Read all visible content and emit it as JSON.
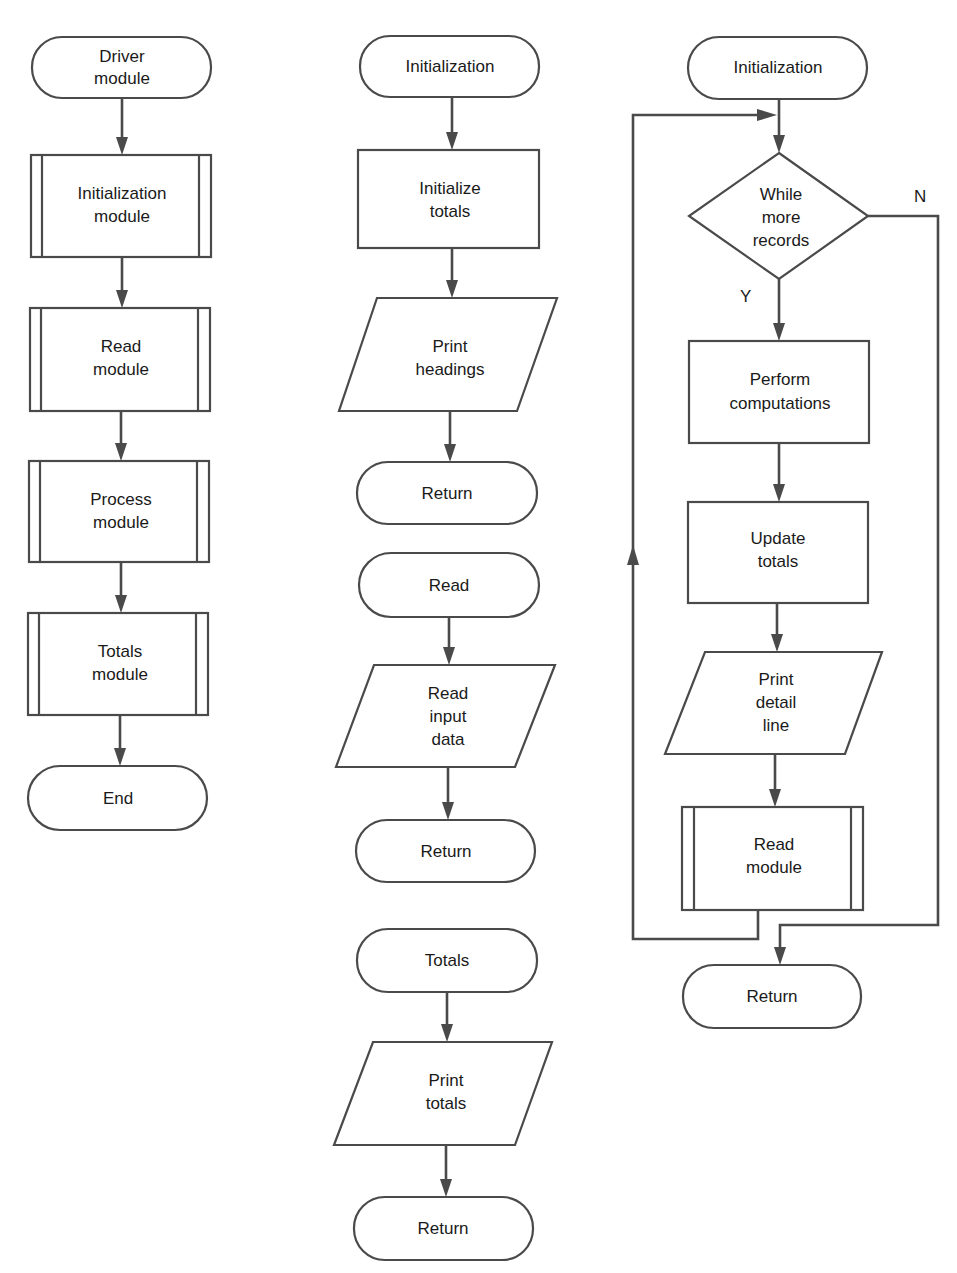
{
  "diagram": {
    "type": "flowchart",
    "colors": {
      "stroke": "#4a4a4a",
      "text": "#1a1a1a",
      "background": "#ffffff"
    },
    "columns": [
      {
        "name": "driver",
        "nodes": [
          {
            "id": "driver",
            "shape": "terminal",
            "lines": [
              "Driver",
              "module"
            ]
          },
          {
            "id": "init_module",
            "shape": "predefined-process",
            "lines": [
              "Initialization",
              "module"
            ]
          },
          {
            "id": "read_module",
            "shape": "predefined-process",
            "lines": [
              "Read",
              "module"
            ]
          },
          {
            "id": "process_module",
            "shape": "predefined-process",
            "lines": [
              "Process",
              "module"
            ]
          },
          {
            "id": "totals_module",
            "shape": "predefined-process",
            "lines": [
              "Totals",
              "module"
            ]
          },
          {
            "id": "end",
            "shape": "terminal",
            "lines": [
              "End"
            ]
          }
        ]
      },
      {
        "name": "subroutines",
        "nodes": [
          {
            "id": "init_start",
            "shape": "terminal",
            "lines": [
              "Initialization"
            ]
          },
          {
            "id": "init_totals",
            "shape": "process",
            "lines": [
              "Initialize",
              "totals"
            ]
          },
          {
            "id": "print_headings",
            "shape": "io",
            "lines": [
              "Print",
              "headings"
            ]
          },
          {
            "id": "init_return",
            "shape": "terminal",
            "lines": [
              "Return"
            ]
          },
          {
            "id": "read_start",
            "shape": "terminal",
            "lines": [
              "Read"
            ]
          },
          {
            "id": "read_input",
            "shape": "io",
            "lines": [
              "Read",
              "input",
              "data"
            ]
          },
          {
            "id": "read_return",
            "shape": "terminal",
            "lines": [
              "Return"
            ]
          },
          {
            "id": "totals_start",
            "shape": "terminal",
            "lines": [
              "Totals"
            ]
          },
          {
            "id": "print_totals",
            "shape": "io",
            "lines": [
              "Print",
              "totals"
            ]
          },
          {
            "id": "totals_return",
            "shape": "terminal",
            "lines": [
              "Return"
            ]
          }
        ]
      },
      {
        "name": "process",
        "nodes": [
          {
            "id": "proc_start",
            "shape": "terminal",
            "lines": [
              "Initialization"
            ]
          },
          {
            "id": "while_more",
            "shape": "decision",
            "lines": [
              "While",
              "more",
              "records"
            ]
          },
          {
            "id": "perform",
            "shape": "process",
            "lines": [
              "Perform",
              "computations"
            ]
          },
          {
            "id": "update",
            "shape": "process",
            "lines": [
              "Update",
              "totals"
            ]
          },
          {
            "id": "print_detail",
            "shape": "io",
            "lines": [
              "Print",
              "detail",
              "line"
            ]
          },
          {
            "id": "proc_read",
            "shape": "predefined-process",
            "lines": [
              "Read",
              "module"
            ]
          },
          {
            "id": "proc_return",
            "shape": "terminal",
            "lines": [
              "Return"
            ]
          }
        ],
        "branch_labels": {
          "yes": "Y",
          "no": "N"
        }
      }
    ]
  }
}
